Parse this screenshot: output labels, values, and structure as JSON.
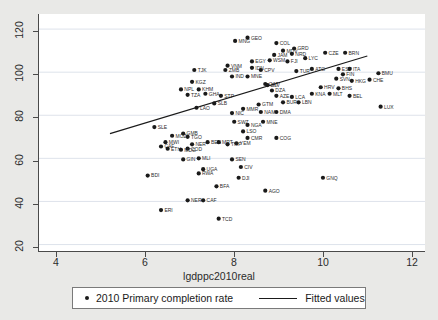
{
  "chart_data": {
    "type": "scatter",
    "title": "",
    "xlabel": "lgdppc2010real",
    "ylabel": "",
    "xlim": [
      3.6,
      12.3
    ],
    "ylim": [
      17,
      127
    ],
    "xticks": [
      4,
      6,
      8,
      10,
      12
    ],
    "yticks": [
      20,
      40,
      60,
      80,
      100,
      120
    ],
    "grid": "horizontal",
    "legend_position": "bottom",
    "legend": [
      {
        "label": "2010 Primary completion rate",
        "marker": "dot"
      },
      {
        "label": "Fitted values",
        "marker": "line"
      }
    ],
    "fit_line": {
      "x0": 5.2,
      "y0": 71.5,
      "x1": 11.0,
      "y1": 107.5
    },
    "series": [
      {
        "name": "2010 Primary completion rate",
        "points": [
          {
            "label": "MNG",
            "x": 8.02,
            "y": 114.5
          },
          {
            "label": "GEO",
            "x": 8.3,
            "y": 116.0
          },
          {
            "label": "COL",
            "x": 8.95,
            "y": 113.5
          },
          {
            "label": "GRD",
            "x": 9.35,
            "y": 111.0
          },
          {
            "label": "MDV",
            "x": 9.1,
            "y": 110.0
          },
          {
            "label": "CZE",
            "x": 10.05,
            "y": 109.0
          },
          {
            "label": "BRN",
            "x": 10.5,
            "y": 109.0
          },
          {
            "label": "EGY",
            "x": 8.4,
            "y": 105.0
          },
          {
            "label": "WSM",
            "x": 8.8,
            "y": 105.5
          },
          {
            "label": "JAM",
            "x": 8.9,
            "y": 108.0
          },
          {
            "label": "NRD",
            "x": 9.3,
            "y": 108.5
          },
          {
            "label": "IDN",
            "x": 8.4,
            "y": 102.0
          },
          {
            "label": "VNM",
            "x": 7.85,
            "y": 103.0
          },
          {
            "label": "ZMB",
            "x": 7.8,
            "y": 101.0
          },
          {
            "label": "TJK",
            "x": 7.1,
            "y": 101.0
          },
          {
            "label": "KGZ",
            "x": 7.05,
            "y": 95.5
          },
          {
            "label": "IND",
            "x": 7.95,
            "y": 98.0
          },
          {
            "label": "MNE",
            "x": 8.3,
            "y": 98.0
          },
          {
            "label": "LYC",
            "x": 9.6,
            "y": 106.5
          },
          {
            "label": "FJI",
            "x": 9.2,
            "y": 105.0
          },
          {
            "label": "CPV",
            "x": 8.6,
            "y": 101.0
          },
          {
            "label": "TUR",
            "x": 9.4,
            "y": 100.5
          },
          {
            "label": "ATG",
            "x": 9.75,
            "y": 101.5
          },
          {
            "label": "ESP",
            "x": 10.35,
            "y": 101.5
          },
          {
            "label": "ITA",
            "x": 10.6,
            "y": 101.5
          },
          {
            "label": "BMU",
            "x": 11.25,
            "y": 99.5
          },
          {
            "label": "QAT",
            "x": 8.7,
            "y": 94.5
          },
          {
            "label": "NPL",
            "x": 6.8,
            "y": 92.0
          },
          {
            "label": "KHM",
            "x": 7.2,
            "y": 92.0
          },
          {
            "label": "TZA",
            "x": 6.95,
            "y": 89.5
          },
          {
            "label": "GHA",
            "x": 7.35,
            "y": 90.0
          },
          {
            "label": "STP",
            "x": 7.7,
            "y": 89.0
          },
          {
            "label": "SLV",
            "x": 8.75,
            "y": 94.0
          },
          {
            "label": "DZA",
            "x": 8.85,
            "y": 91.5
          },
          {
            "label": "AZE",
            "x": 8.95,
            "y": 89.0
          },
          {
            "label": "FIN",
            "x": 10.45,
            "y": 99.0
          },
          {
            "label": "SVN",
            "x": 10.3,
            "y": 97.0
          },
          {
            "label": "HKG",
            "x": 10.65,
            "y": 96.0
          },
          {
            "label": "CHE",
            "x": 11.05,
            "y": 96.5
          },
          {
            "label": "SLB",
            "x": 7.55,
            "y": 85.5
          },
          {
            "label": "LAO",
            "x": 7.15,
            "y": 83.5
          },
          {
            "label": "GTM",
            "x": 8.55,
            "y": 85.0
          },
          {
            "label": "HRV",
            "x": 9.95,
            "y": 93.0
          },
          {
            "label": "KNA",
            "x": 9.75,
            "y": 90.0
          },
          {
            "label": "MLT",
            "x": 10.15,
            "y": 90.0
          },
          {
            "label": "BHS",
            "x": 10.35,
            "y": 92.5
          },
          {
            "label": "BEL",
            "x": 10.6,
            "y": 89.0
          },
          {
            "label": "NIC",
            "x": 7.95,
            "y": 81.0
          },
          {
            "label": "BUR",
            "x": 9.1,
            "y": 86.0
          },
          {
            "label": "LBN",
            "x": 9.45,
            "y": 86.0
          },
          {
            "label": "LCA",
            "x": 9.3,
            "y": 88.5
          },
          {
            "label": "MMR",
            "x": 8.2,
            "y": 83.0
          },
          {
            "label": "NAM",
            "x": 8.6,
            "y": 81.5
          },
          {
            "label": "DMA",
            "x": 8.95,
            "y": 81.5
          },
          {
            "label": "LUX",
            "x": 11.3,
            "y": 84.0
          },
          {
            "label": "SLE",
            "x": 6.2,
            "y": 74.5
          },
          {
            "label": "NGA",
            "x": 8.3,
            "y": 75.5
          },
          {
            "label": "SWZ",
            "x": 8.0,
            "y": 77.0
          },
          {
            "label": "MNE",
            "x": 8.65,
            "y": 77.0
          },
          {
            "label": "GMB",
            "x": 6.85,
            "y": 71.5
          },
          {
            "label": "LSO",
            "x": 8.2,
            "y": 72.5
          },
          {
            "label": "TGO",
            "x": 6.95,
            "y": 70.0
          },
          {
            "label": "MOZ",
            "x": 6.6,
            "y": 70.5
          },
          {
            "label": "CMR",
            "x": 8.3,
            "y": 69.5
          },
          {
            "label": "COG",
            "x": 8.95,
            "y": 69.5
          },
          {
            "label": "MWI",
            "x": 6.45,
            "y": 67.5
          },
          {
            "label": "BEN",
            "x": 7.4,
            "y": 67.5
          },
          {
            "label": "MRT",
            "x": 7.65,
            "y": 67.5
          },
          {
            "label": "NER",
            "x": 7.05,
            "y": 66.5
          },
          {
            "label": "YEM",
            "x": 8.05,
            "y": 67.0
          },
          {
            "label": "TMP",
            "x": 7.85,
            "y": 66.5
          },
          {
            "label": "CAF",
            "x": 6.35,
            "y": 65.5
          },
          {
            "label": "ETH",
            "x": 6.5,
            "y": 64.5
          },
          {
            "label": "COD",
            "x": 6.95,
            "y": 64.5
          },
          {
            "label": "MDG",
            "x": 6.8,
            "y": 64.0
          },
          {
            "label": "GIN",
            "x": 6.85,
            "y": 59.5
          },
          {
            "label": "MLI",
            "x": 7.2,
            "y": 60.0
          },
          {
            "label": "SEN",
            "x": 7.95,
            "y": 59.5
          },
          {
            "label": "UGA",
            "x": 7.3,
            "y": 55.0
          },
          {
            "label": "CIV",
            "x": 8.15,
            "y": 56.0
          },
          {
            "label": "RWA",
            "x": 7.2,
            "y": 53.0
          },
          {
            "label": "DJI",
            "x": 8.1,
            "y": 51.0
          },
          {
            "label": "BDI",
            "x": 6.05,
            "y": 52.0
          },
          {
            "label": "BFA",
            "x": 7.6,
            "y": 47.0
          },
          {
            "label": "GNQ",
            "x": 10.0,
            "y": 51.0
          },
          {
            "label": "AGO",
            "x": 8.7,
            "y": 45.0
          },
          {
            "label": "NER",
            "x": 6.95,
            "y": 40.5
          },
          {
            "label": "CAF",
            "x": 7.3,
            "y": 40.5
          },
          {
            "label": "ERI",
            "x": 6.35,
            "y": 36.0
          },
          {
            "label": "TCD",
            "x": 7.65,
            "y": 32.0
          }
        ]
      }
    ]
  },
  "axis": {
    "ytick_labels": [
      "120",
      "100",
      "80",
      "60",
      "40",
      "20"
    ],
    "xtick_labels": [
      "4",
      "6",
      "8",
      "10",
      "12"
    ]
  }
}
